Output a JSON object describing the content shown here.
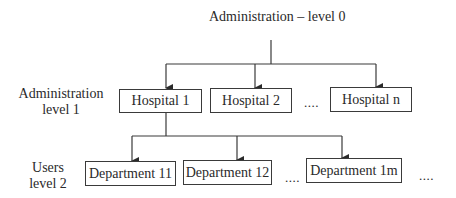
{
  "diagram": {
    "title": "Administration – level 0",
    "levels": [
      {
        "name": "Administration",
        "sub": "level 1"
      },
      {
        "name": "Users",
        "sub": "level 2"
      }
    ],
    "hospitals": [
      {
        "label": "Hospital 1"
      },
      {
        "label": "Hospital 2"
      },
      {
        "label": "Hospital n"
      }
    ],
    "departments": [
      {
        "label": "Department 11"
      },
      {
        "label": "Department 12"
      },
      {
        "label": "Department 1m"
      }
    ],
    "ellipsis": "....",
    "colors": {
      "line": "#3a3a3a",
      "text": "#2a2a2a",
      "background": "#ffffff"
    }
  }
}
